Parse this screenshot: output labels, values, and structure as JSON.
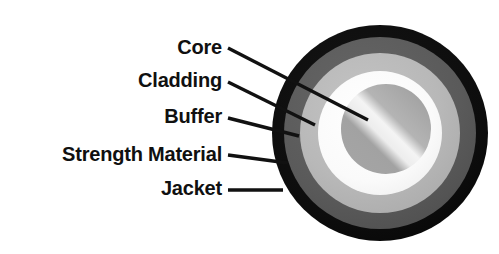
{
  "figure": {
    "background_color": "#ffffff"
  },
  "labels": [
    {
      "id": "core",
      "text": "Core",
      "text_x": 222,
      "text_y": 54,
      "line": {
        "x1": 228,
        "y1": 48,
        "x2": 368,
        "y2": 120
      },
      "target_layer": "core"
    },
    {
      "id": "cladding",
      "text": "Cladding",
      "text_x": 222,
      "text_y": 87,
      "line": {
        "x1": 228,
        "y1": 82,
        "x2": 315,
        "y2": 125
      },
      "target_layer": "cladding"
    },
    {
      "id": "buffer",
      "text": "Buffer",
      "text_x": 222,
      "text_y": 123,
      "line": {
        "x1": 228,
        "y1": 118,
        "x2": 299,
        "y2": 136
      },
      "target_layer": "buffer"
    },
    {
      "id": "strength-material",
      "text": "Strength Material",
      "text_x": 222,
      "text_y": 161,
      "line": {
        "x1": 228,
        "y1": 155,
        "x2": 288,
        "y2": 163
      },
      "target_layer": "strength-material"
    },
    {
      "id": "jacket",
      "text": "Jacket",
      "text_x": 222,
      "text_y": 195,
      "line": {
        "x1": 228,
        "y1": 190,
        "x2": 283,
        "y2": 190
      },
      "target_layer": "jacket"
    }
  ],
  "cable": {
    "center_x": 380,
    "center_y": 133,
    "layers": [
      {
        "id": "jacket",
        "name": "Jacket",
        "radius": 108,
        "color": "#0d0d0d"
      },
      {
        "id": "strength-material",
        "name": "Strength Material",
        "radius": 96,
        "color": "#595959"
      },
      {
        "id": "buffer",
        "name": "Buffer",
        "radius": 80,
        "color": "#b7b7b7"
      },
      {
        "id": "cladding",
        "name": "Cladding",
        "radius": 62,
        "color": "#fbfbfb"
      },
      {
        "id": "core",
        "name": "Core",
        "radius": 45,
        "color": "#9d9d9d",
        "offset_x": 6,
        "offset_y": -4,
        "highlight_color": "#f2f2f2"
      }
    ]
  },
  "colors": {
    "text": "#101010",
    "leader_line": "#111111",
    "jacket": "#0d0d0d",
    "strength_material": "#595959",
    "buffer": "#b7b7b7",
    "cladding": "#fbfbfb",
    "core": "#9d9d9d",
    "core_highlight": "#f2f2f2"
  }
}
